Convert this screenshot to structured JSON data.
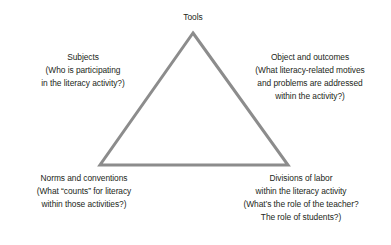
{
  "figure": {
    "type": "activity-system-triangle",
    "background_color": "#ffffff",
    "text_color": "#231f20",
    "stroke_color": "#8c8c8c",
    "stroke_width": 3
  },
  "triangle": {
    "apex": {
      "x": 193,
      "y": 33
    },
    "bottom_left": {
      "x": 100,
      "y": 165
    },
    "bottom_right": {
      "x": 288,
      "y": 165
    },
    "filled": false
  },
  "labels": {
    "apex": {
      "name": "Tools",
      "lines": [
        "Tools"
      ]
    },
    "upper_left": {
      "name": "Subjects",
      "lines": [
        "Subjects",
        "(Who is participating",
        "in the literacy activity?)"
      ]
    },
    "upper_right": {
      "name": "Object and outcomes",
      "lines": [
        "Object and outcomes",
        "(What literacy-related motives",
        "and problems are addressed",
        "within the activity?)"
      ]
    },
    "lower_left": {
      "name": "Norms and conventions",
      "lines": [
        "Norms and conventions",
        "(What “counts” for literacy",
        "within those activities?)"
      ]
    },
    "lower_right": {
      "name": "Divisions of labor",
      "lines": [
        "Divisions of labor",
        "within the literacy activity",
        "(What’s the role of the teacher?",
        "The role of students?)"
      ]
    }
  }
}
